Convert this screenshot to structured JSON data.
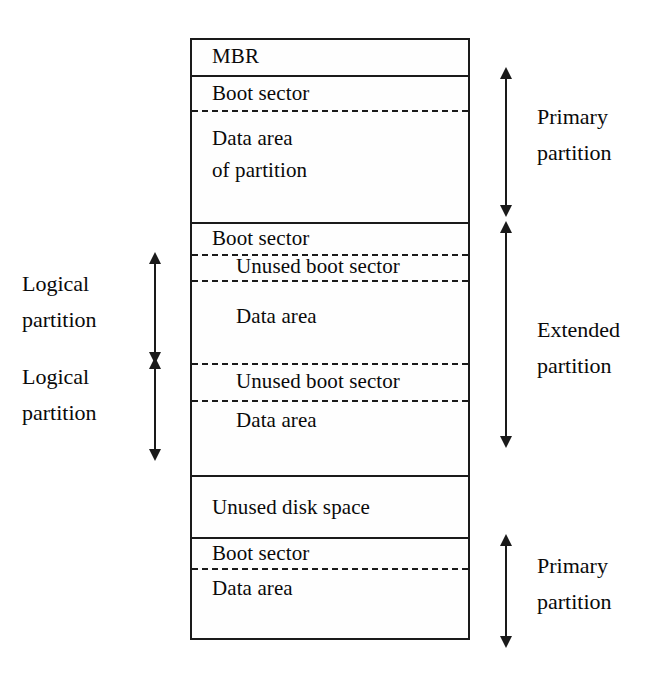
{
  "diagram": {
    "colors": {
      "line": "#1a1a1a",
      "background": "#ffffff",
      "text": "#0a0a0a"
    },
    "disk_regions": [
      {
        "id": "mbr",
        "label": "MBR",
        "divider_above": "none",
        "indent": 1
      },
      {
        "id": "primary-boot",
        "label": "Boot sector",
        "divider_above": "solid",
        "indent": 1
      },
      {
        "id": "primary-data",
        "label": "Data area",
        "divider_above": "dashed",
        "indent": 1
      },
      {
        "id": "primary-data-line2",
        "label": "of partition",
        "divider_above": "none",
        "indent": 1
      },
      {
        "id": "ext-boot",
        "label": "Boot sector",
        "divider_above": "solid",
        "indent": 1
      },
      {
        "id": "log1-unused-boot",
        "label": "Unused boot sector",
        "divider_above": "dashed",
        "indent": 2
      },
      {
        "id": "log1-data",
        "label": "Data area",
        "divider_above": "dashed",
        "indent": 2
      },
      {
        "id": "log2-unused-boot",
        "label": "Unused boot sector",
        "divider_above": "dashed",
        "indent": 2
      },
      {
        "id": "log2-data",
        "label": "Data area",
        "divider_above": "dashed",
        "indent": 2
      },
      {
        "id": "unused-disk",
        "label": "Unused disk space",
        "divider_above": "solid",
        "indent": 1
      },
      {
        "id": "primary2-boot",
        "label": "Boot sector",
        "divider_above": "solid",
        "indent": 1
      },
      {
        "id": "primary2-data",
        "label": "Data area",
        "divider_above": "dashed",
        "indent": 1
      }
    ],
    "right_annotations": [
      {
        "id": "primary-partition-top",
        "line1": "Primary",
        "line2": "partition"
      },
      {
        "id": "extended-partition",
        "line1": "Extended",
        "line2": "partition"
      },
      {
        "id": "primary-partition-bottom",
        "line1": "Primary",
        "line2": "partition"
      }
    ],
    "left_annotations": [
      {
        "id": "logical-partition-1",
        "line1": "Logical",
        "line2": "partition"
      },
      {
        "id": "logical-partition-2",
        "line1": "Logical",
        "line2": "partition"
      }
    ]
  }
}
